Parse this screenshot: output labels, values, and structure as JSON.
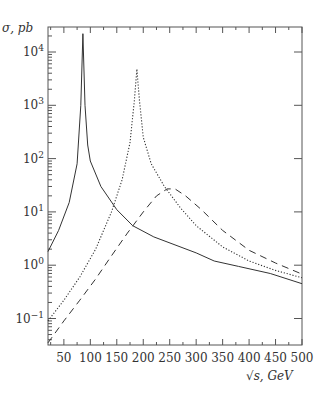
{
  "chart_data": {
    "type": "line",
    "title": "",
    "xlabel": "√s, GeV",
    "ylabel": "σ, pb",
    "xlim": [
      20,
      500
    ],
    "ylim": [
      0.03,
      40000
    ],
    "yscale": "log",
    "grid": false,
    "legend": null,
    "x_ticks": [
      50,
      100,
      150,
      200,
      250,
      300,
      350,
      400,
      450,
      500
    ],
    "y_ticks": [
      {
        "value": 0.1,
        "base": "10",
        "exp": "−1"
      },
      {
        "value": 1,
        "base": "10",
        "exp": "0"
      },
      {
        "value": 10,
        "base": "10",
        "exp": "1"
      },
      {
        "value": 100,
        "base": "10",
        "exp": "2"
      },
      {
        "value": 1000,
        "base": "10",
        "exp": "3"
      },
      {
        "value": 10000,
        "base": "10",
        "exp": "4"
      }
    ],
    "series": [
      {
        "name": "solid",
        "style": "solid",
        "color": "#333333",
        "x": [
          20,
          40,
          60,
          75,
          82,
          86,
          90,
          95,
          100,
          120,
          150,
          180,
          220,
          260,
          300,
          334,
          380,
          440,
          500
        ],
        "y": [
          1.8,
          4.5,
          15,
          80,
          1000,
          22000,
          1000,
          180,
          90,
          30,
          11,
          5.5,
          3.4,
          2.4,
          1.7,
          1.2,
          0.95,
          0.7,
          0.45
        ]
      },
      {
        "name": "dotted",
        "style": "dotted",
        "color": "#333333",
        "x": [
          20,
          50,
          80,
          110,
          140,
          160,
          175,
          183,
          188,
          193,
          200,
          215,
          240,
          270,
          300,
          350,
          400,
          450,
          500
        ],
        "y": [
          0.09,
          0.22,
          0.6,
          2.0,
          10,
          40,
          200,
          1200,
          4800,
          1200,
          250,
          80,
          30,
          12,
          5.5,
          2.2,
          1.2,
          0.8,
          0.58
        ]
      },
      {
        "name": "dashed",
        "style": "dashed",
        "color": "#333333",
        "x": [
          20,
          50,
          80,
          110,
          140,
          170,
          200,
          225,
          245,
          260,
          280,
          310,
          350,
          400,
          450,
          500
        ],
        "y": [
          0.035,
          0.09,
          0.22,
          0.55,
          1.5,
          4.0,
          10,
          20,
          27,
          27,
          20,
          11,
          4.5,
          1.9,
          1.1,
          0.68
        ]
      }
    ]
  }
}
